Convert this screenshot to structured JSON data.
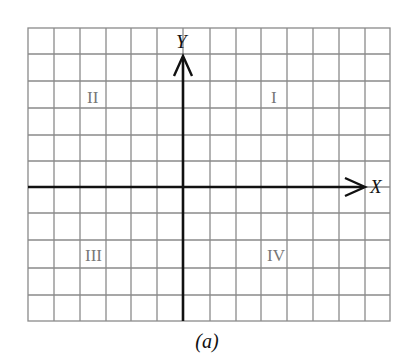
{
  "diagram": {
    "type": "cartesian-plane-quadrants",
    "grid": {
      "columns": 14,
      "rows": 11,
      "origin_column": 6,
      "origin_row": 6
    },
    "axes": {
      "x_label": "X",
      "y_label": "Y"
    },
    "quadrants": [
      {
        "id": "q1",
        "label": "I"
      },
      {
        "id": "q2",
        "label": "II"
      },
      {
        "id": "q3",
        "label": "III"
      },
      {
        "id": "q4",
        "label": "IV"
      }
    ],
    "caption": "(a)",
    "colors": {
      "grid": "#8a8a8a",
      "axis": "#111111",
      "quadrant_label": "#777777"
    }
  }
}
